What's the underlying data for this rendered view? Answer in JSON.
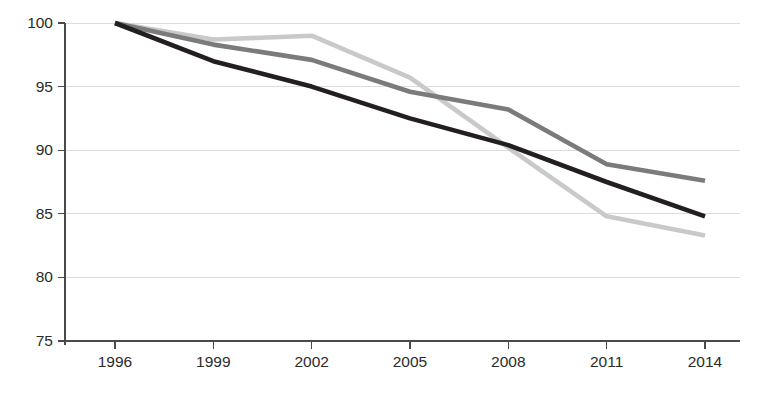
{
  "chart_data": {
    "type": "line",
    "title": "",
    "subtitle": "",
    "xlabel": "",
    "ylabel": "",
    "categories": [
      "1996",
      "1999",
      "2002",
      "2005",
      "2008",
      "2011",
      "2014"
    ],
    "x": [
      1996,
      1999,
      2002,
      2005,
      2008,
      2011,
      2014
    ],
    "xlim": [
      1996,
      2014
    ],
    "ylim": [
      75,
      100
    ],
    "y_ticks": [
      75,
      80,
      85,
      90,
      95,
      100
    ],
    "x_ticks": [
      "1996",
      "1999",
      "2002",
      "2005",
      "2008",
      "2011",
      "2014"
    ],
    "grid": true,
    "grid_axis": "y",
    "legend": false,
    "legend_position": "none",
    "annotations": [],
    "series": [
      {
        "name": "series-light-gray",
        "color": "#c9c9c9",
        "values": [
          100.0,
          98.7,
          99.0,
          95.7,
          90.2,
          84.8,
          83.3
        ]
      },
      {
        "name": "series-medium-gray",
        "color": "#7b7b7b",
        "values": [
          100.0,
          98.3,
          97.1,
          94.6,
          93.2,
          88.9,
          87.6
        ]
      },
      {
        "name": "series-black",
        "color": "#231f20",
        "values": [
          100.0,
          97.0,
          95.0,
          92.5,
          90.4,
          87.5,
          84.8
        ]
      }
    ]
  },
  "axis": {
    "y_tick_labels": [
      "100",
      "95",
      "90",
      "85",
      "80",
      "75"
    ],
    "x_tick_labels": [
      "1996",
      "1999",
      "2002",
      "2005",
      "2008",
      "2011",
      "2014"
    ]
  },
  "colors": {
    "background": "#ffffff",
    "grid": "#d8d8d8",
    "axis": "#4a4a4a",
    "text": "#2b2b2b",
    "series_light": "#c9c9c9",
    "series_medium": "#7b7b7b",
    "series_dark": "#231f20"
  }
}
